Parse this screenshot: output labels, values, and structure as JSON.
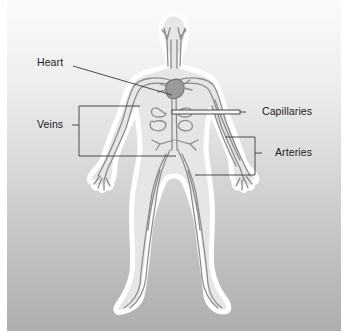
{
  "diagram": {
    "labels": {
      "heart": "Heart",
      "veins": "Veins",
      "capillaries": "Capillaries",
      "arteries": "Arteries"
    },
    "colors": {
      "background_top": "#fbfbfb",
      "background_bottom": "#aeaeae",
      "body_outline": "#ffffff",
      "body_fill": "#e4e4e4",
      "vessel": "#8a8a8a",
      "leader_line": "#333333",
      "label_text": "#1a1a1a"
    }
  }
}
